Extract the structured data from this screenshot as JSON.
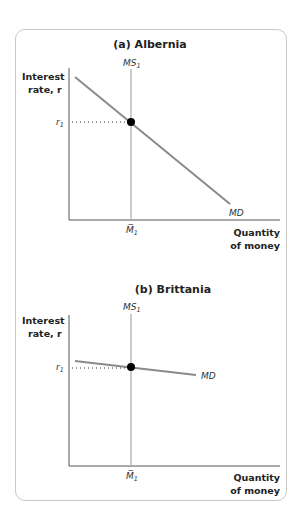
{
  "figure": {
    "panels": [
      {
        "title": "(a) Albernia",
        "y_axis_label_line1": "Interest",
        "y_axis_label_line2": "rate, r",
        "x_axis_label_line1": "Quantity",
        "x_axis_label_line2": "of money",
        "supply_label": "MS",
        "supply_sub": "1",
        "demand_label": "MD",
        "rate_label": "r",
        "rate_sub": "1",
        "money_label": "M̅",
        "money_sub": "1",
        "demand_slope": "steep"
      },
      {
        "title": "(b) Brittania",
        "y_axis_label_line1": "Interest",
        "y_axis_label_line2": "rate, r",
        "x_axis_label_line1": "Quantity",
        "x_axis_label_line2": "of money",
        "supply_label": "MS",
        "supply_sub": "1",
        "demand_label": "MD",
        "rate_label": "r",
        "rate_sub": "1",
        "money_label": "M̅",
        "money_sub": "1",
        "demand_slope": "flat"
      }
    ],
    "colors": {
      "curve": "#8a8a8a",
      "axis": "#555555",
      "supply": "#b5b5b5",
      "point": "#000000",
      "frame": "#c8c8c8"
    }
  }
}
